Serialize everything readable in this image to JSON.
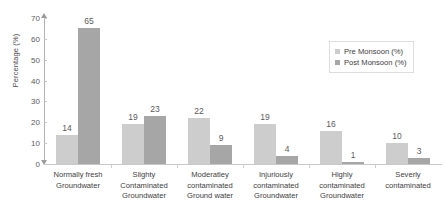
{
  "chart_data": {
    "type": "bar",
    "title": "",
    "xlabel": "",
    "ylabel": "Percentage (%)",
    "ylim": [
      0,
      70
    ],
    "yticks": [
      0,
      10,
      20,
      30,
      40,
      50,
      60,
      70
    ],
    "grid": false,
    "legend_position": "top-right",
    "categories": [
      "Normally fresh Groundwater",
      "Slighty Contaminated Groundwater",
      "Moderatley contaminated Ground water",
      "Injuriously contaminated Groundwater",
      "Highly contaminated Groundwater",
      "Severly contaminated"
    ],
    "category_lines": [
      [
        "Normally fresh",
        "Groundwater"
      ],
      [
        "Slighty",
        "Contaminated",
        "Groundwater"
      ],
      [
        "Moderatley",
        "contaminated",
        "Ground water"
      ],
      [
        "Injuriously",
        "contaminated",
        "Groundwater"
      ],
      [
        "Highly",
        "contaminated",
        "Groundwater"
      ],
      [
        "Severly",
        "contaminated"
      ]
    ],
    "series": [
      {
        "name": "Pre Monsoon (%)",
        "color": "#cdcdcd",
        "values": [
          14,
          19,
          22,
          19,
          16,
          10
        ]
      },
      {
        "name": "Post Monsoon (%)",
        "color": "#a6a6a6",
        "values": [
          65,
          23,
          9,
          4,
          1,
          3
        ]
      }
    ]
  },
  "axis": {
    "y_title": "Percentage (%)",
    "y_tick_labels": [
      "70",
      "60",
      "50",
      "40",
      "30",
      "20",
      "10",
      "0"
    ]
  },
  "legend": {
    "items": [
      {
        "label": "Pre Monsoon (%)"
      },
      {
        "label": "Post Monsoon (%)"
      }
    ]
  }
}
